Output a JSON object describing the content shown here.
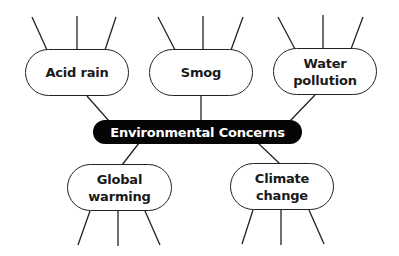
{
  "diagram": {
    "type": "concept-map",
    "center": {
      "label": "Environmental Concerns",
      "fill": "#050505",
      "text_color": "#ffffff"
    },
    "nodes": [
      {
        "id": "acid-rain",
        "label": "Acid rain"
      },
      {
        "id": "smog",
        "label": "Smog"
      },
      {
        "id": "water-pollution",
        "label": "Water\npollution"
      },
      {
        "id": "global-warming",
        "label": "Global\nwarming"
      },
      {
        "id": "climate-change",
        "label": "Climate\nchange"
      }
    ],
    "spokes_per_node": 3,
    "spoke_note": "Each outer node has 3 empty blank lines for details"
  }
}
